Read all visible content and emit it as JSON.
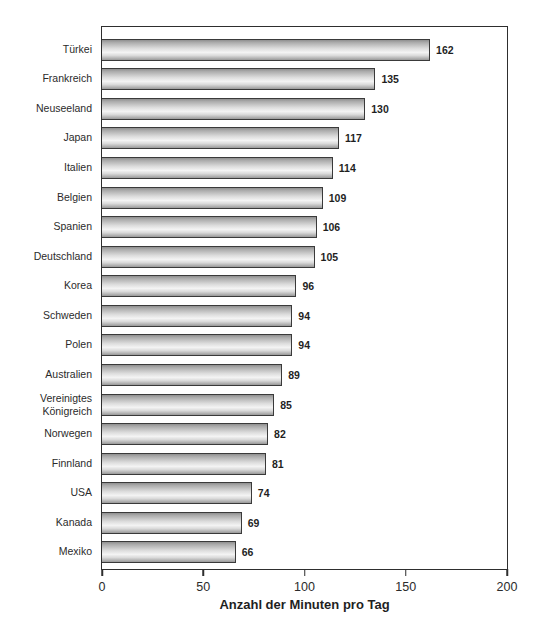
{
  "chart_data": {
    "type": "bar",
    "orientation": "horizontal",
    "categories": [
      "Türkei",
      "Frankreich",
      "Neuseeland",
      "Japan",
      "Italien",
      "Belgien",
      "Spanien",
      "Deutschland",
      "Korea",
      "Schweden",
      "Polen",
      "Australien",
      "Vereinigtes Königreich",
      "Norwegen",
      "Finnland",
      "USA",
      "Kanada",
      "Mexiko"
    ],
    "values": [
      162,
      135,
      130,
      117,
      114,
      109,
      106,
      105,
      96,
      94,
      94,
      89,
      85,
      82,
      81,
      74,
      69,
      66
    ],
    "title": "",
    "xlabel": "Anzahl der Minuten pro Tag",
    "ylabel": "",
    "xlim": [
      0,
      200
    ],
    "xticks": [
      0,
      50,
      100,
      150,
      200
    ],
    "grid": "off",
    "legend": "none",
    "value_labels_shown": true,
    "colors": {
      "bar_highlight": "#f4f4f4",
      "bar_shadow": "#8f8f8f",
      "bar_border": "#3a3a3a",
      "frame": "#2e2e2e",
      "text": "#2b2b2b",
      "background": "#ffffff"
    }
  }
}
